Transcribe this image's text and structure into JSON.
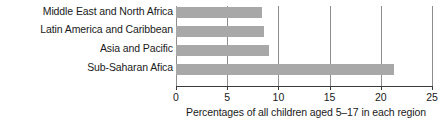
{
  "chart_data": {
    "type": "bar",
    "orientation": "horizontal",
    "title": "",
    "xlabel": "Percentages of all children aged 5–17 in each region",
    "ylabel": "",
    "categories": [
      "Middle East and North Africa",
      "Latin America and Caribbean",
      "Asia and Pacific",
      "Sub-Saharan Afica"
    ],
    "values": [
      8.4,
      8.6,
      9.1,
      21.3
    ],
    "xlim": [
      0,
      25
    ],
    "xticks": [
      0,
      5,
      10,
      15,
      20,
      25
    ],
    "xtick_labels": [
      "0",
      "5",
      "10",
      "15",
      "20",
      "25"
    ],
    "grid": "vertical",
    "legend": "none",
    "bar_color": "#a8a8a8",
    "gridline_color": "#8d8d8d",
    "axis_color": "#3a3a3a",
    "text_color": "#1a1a1a",
    "background": "#ffffff"
  }
}
